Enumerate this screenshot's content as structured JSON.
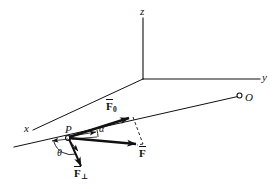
{
  "figure": {
    "background_color": "#ffffff",
    "stroke_color": "#111111",
    "width": 278,
    "height": 189
  },
  "axes": {
    "z_label": "z",
    "y_label": "y",
    "x_label": "x",
    "origin_x": 143,
    "origin_y": 79
  },
  "points": {
    "P": {
      "label": "P",
      "x": 68,
      "y": 133
    },
    "O": {
      "label": "O",
      "x": 245,
      "y": 97
    }
  },
  "vectors": [
    {
      "name": "F-zero",
      "label_base": "F",
      "label_sub": "0",
      "description": "in-plane component along the incline"
    },
    {
      "name": "F-resultant",
      "label_base": "F",
      "label_sub": "",
      "description": "resultant force vector"
    },
    {
      "name": "F-perpendicular",
      "label_base": "F",
      "label_sub": "⊥",
      "description": "component perpendicular to the incline"
    }
  ],
  "angles": [
    {
      "name": "alpha",
      "label": "α",
      "description": "angle between F-zero and F at point P"
    },
    {
      "name": "theta",
      "label": "θ",
      "description": "angle between the plane line and F-perpendicular at point P"
    }
  ]
}
